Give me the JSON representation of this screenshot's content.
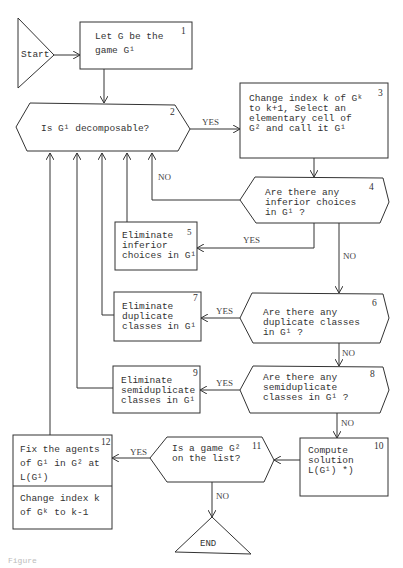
{
  "diagram": {
    "type": "flowchart",
    "nodes": [
      {
        "id": "start",
        "shape": "triangle",
        "label": "Start"
      },
      {
        "id": "1",
        "shape": "rect",
        "number": "1",
        "label": "Let G be the\ngame G¹"
      },
      {
        "id": "2",
        "shape": "hexagon",
        "number": "2",
        "label": "Is G¹ decomposable?"
      },
      {
        "id": "3",
        "shape": "rect",
        "number": "3",
        "label": "Change index k of Gᵏ\nto k+1,  Select an\nelementary cell of\nG² and call it G¹"
      },
      {
        "id": "4",
        "shape": "hexagon",
        "number": "4",
        "label": "Are there any\ninferior choices\nin G¹ ?"
      },
      {
        "id": "5",
        "shape": "rect",
        "number": "5",
        "label": "Eliminate\ninferior\nchoices in G¹"
      },
      {
        "id": "6",
        "shape": "hexagon",
        "number": "6",
        "label": "Are there any\nduplicate classes\nin G¹ ?"
      },
      {
        "id": "7",
        "shape": "rect",
        "number": "7",
        "label": "Eliminate\nduplicate\nclasses in G¹"
      },
      {
        "id": "8",
        "shape": "hexagon",
        "number": "8",
        "label": "Are there any\nsemiduplicate\nclasses in G¹ ?"
      },
      {
        "id": "9",
        "shape": "rect",
        "number": "9",
        "label": "Eliminate\nsemiduplicate\nclasses in G¹"
      },
      {
        "id": "10",
        "shape": "rect",
        "number": "10",
        "label": "Compute\nsolution\nL(G¹)   *)"
      },
      {
        "id": "11",
        "shape": "hexagon",
        "number": "11",
        "label": "Is a game G²\non the list?"
      },
      {
        "id": "12",
        "shape": "rect",
        "number": "12",
        "label_top": "Fix the agents\nof G¹ in G² at\nL(G¹)",
        "label_bottom": "Change index k\nof Gᵏ to k-1"
      },
      {
        "id": "end",
        "shape": "triangle",
        "label": "END"
      }
    ],
    "edges": [
      {
        "from": "start",
        "to": "1",
        "label": ""
      },
      {
        "from": "1",
        "to": "2",
        "label": ""
      },
      {
        "from": "2",
        "to": "3",
        "label": "YES"
      },
      {
        "from": "3",
        "to": "4",
        "label": ""
      },
      {
        "from": "4",
        "to": "2",
        "label": "NO"
      },
      {
        "from": "4",
        "to": "5",
        "label": "YES"
      },
      {
        "from": "4",
        "to": "6",
        "label": "NO"
      },
      {
        "from": "5",
        "to": "2",
        "label": ""
      },
      {
        "from": "6",
        "to": "7",
        "label": "YES"
      },
      {
        "from": "6",
        "to": "8",
        "label": "NO"
      },
      {
        "from": "7",
        "to": "2",
        "label": ""
      },
      {
        "from": "8",
        "to": "9",
        "label": "YES"
      },
      {
        "from": "8",
        "to": "10",
        "label": "NO"
      },
      {
        "from": "9",
        "to": "2",
        "label": ""
      },
      {
        "from": "10",
        "to": "11",
        "label": ""
      },
      {
        "from": "11",
        "to": "12",
        "label": "YES"
      },
      {
        "from": "11",
        "to": "end",
        "label": "NO"
      },
      {
        "from": "12",
        "to": "2",
        "label": ""
      }
    ]
  },
  "labels": {
    "start": "Start",
    "n1_num": "1",
    "n1_text": "Let G be the\ngame G¹",
    "n2_num": "2",
    "n2_text": "Is G¹ decomposable?",
    "n3_num": "3",
    "n3_text": "Change index k of Gᵏ\nto k+1,  Select an\nelementary cell of\nG² and call it G¹",
    "n4_num": "4",
    "n4_text": "Are there any\ninferior choices\nin G¹ ?",
    "n5_num": "5",
    "n5_text": "Eliminate\ninferior\nchoices in G¹",
    "n6_num": "6",
    "n6_text": "Are there any\nduplicate classes\nin G¹ ?",
    "n7_num": "7",
    "n7_text": "Eliminate\nduplicate\nclasses in G¹",
    "n8_num": "8",
    "n8_text": "Are there any\nsemiduplicate\nclasses in G¹ ?",
    "n9_num": "9",
    "n9_text": "Eliminate\nsemiduplicate\nclasses in G¹",
    "n10_num": "10",
    "n10_text": "Compute\nsolution\nL(G¹)   *)",
    "n11_num": "11",
    "n11_text": "Is a game G²\non the list?",
    "n12_num": "12",
    "n12_top": "Fix the agents\nof G¹ in G² at\nL(G¹)",
    "n12_bottom": "Change index k\nof Gᵏ to k-1",
    "end": "END",
    "yes": "YES",
    "no": "NO",
    "caption": "Figure"
  }
}
